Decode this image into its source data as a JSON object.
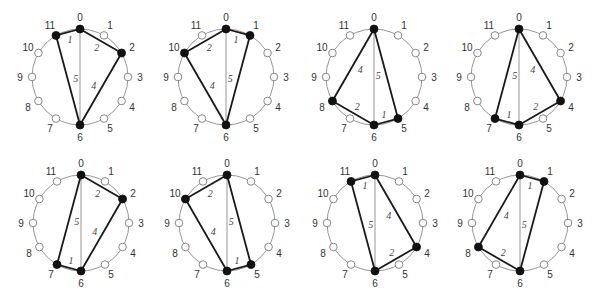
{
  "figure": {
    "point_labels": [
      "0",
      "1",
      "2",
      "3",
      "4",
      "5",
      "6",
      "7",
      "8",
      "9",
      "10",
      "11"
    ],
    "style": {
      "circle_color": "#8a8a8a",
      "edge_color": "#1a1a1a",
      "filled_point_color": "#111111",
      "open_point_fill": "#ffffff"
    },
    "diagrams": [
      {
        "id": 1,
        "cx": 80,
        "cy": 77,
        "filled": [
          0,
          2,
          6,
          11
        ],
        "edges": [
          {
            "from": 11,
            "to": 0,
            "label": "1"
          },
          {
            "from": 0,
            "to": 2,
            "label": "2"
          },
          {
            "from": 2,
            "to": 6,
            "label": "4"
          },
          {
            "from": 6,
            "to": 11,
            "label": "5"
          }
        ]
      },
      {
        "id": 2,
        "cx": 226,
        "cy": 77,
        "filled": [
          0,
          1,
          6,
          10
        ],
        "edges": [
          {
            "from": 0,
            "to": 1,
            "label": "1"
          },
          {
            "from": 1,
            "to": 6,
            "label": "5"
          },
          {
            "from": 6,
            "to": 10,
            "label": "4"
          },
          {
            "from": 10,
            "to": 0,
            "label": "2"
          }
        ]
      },
      {
        "id": 3,
        "cx": 374,
        "cy": 77,
        "filled": [
          0,
          5,
          6,
          8
        ],
        "edges": [
          {
            "from": 0,
            "to": 5,
            "label": "5"
          },
          {
            "from": 5,
            "to": 6,
            "label": "1"
          },
          {
            "from": 6,
            "to": 8,
            "label": "2"
          },
          {
            "from": 8,
            "to": 0,
            "label": "4"
          }
        ]
      },
      {
        "id": 4,
        "cx": 519,
        "cy": 77,
        "filled": [
          0,
          4,
          6,
          7
        ],
        "edges": [
          {
            "from": 0,
            "to": 4,
            "label": "4"
          },
          {
            "from": 4,
            "to": 6,
            "label": "2"
          },
          {
            "from": 6,
            "to": 7,
            "label": "1"
          },
          {
            "from": 7,
            "to": 0,
            "label": "5"
          }
        ]
      },
      {
        "id": 5,
        "cx": 81,
        "cy": 223,
        "filled": [
          0,
          2,
          6,
          7
        ],
        "edges": [
          {
            "from": 0,
            "to": 2,
            "label": "2"
          },
          {
            "from": 2,
            "to": 6,
            "label": "4"
          },
          {
            "from": 6,
            "to": 7,
            "label": "1"
          },
          {
            "from": 7,
            "to": 0,
            "label": "5"
          }
        ]
      },
      {
        "id": 6,
        "cx": 227,
        "cy": 223,
        "filled": [
          0,
          5,
          6,
          10
        ],
        "edges": [
          {
            "from": 0,
            "to": 5,
            "label": "5"
          },
          {
            "from": 5,
            "to": 6,
            "label": "1"
          },
          {
            "from": 6,
            "to": 10,
            "label": "4"
          },
          {
            "from": 10,
            "to": 0,
            "label": "2"
          }
        ]
      },
      {
        "id": 7,
        "cx": 375,
        "cy": 223,
        "filled": [
          0,
          4,
          6,
          11
        ],
        "edges": [
          {
            "from": 11,
            "to": 0,
            "label": "1"
          },
          {
            "from": 0,
            "to": 4,
            "label": "4"
          },
          {
            "from": 4,
            "to": 6,
            "label": "2"
          },
          {
            "from": 6,
            "to": 11,
            "label": "5"
          }
        ]
      },
      {
        "id": 8,
        "cx": 520,
        "cy": 223,
        "filled": [
          0,
          1,
          6,
          8
        ],
        "edges": [
          {
            "from": 0,
            "to": 1,
            "label": "1"
          },
          {
            "from": 1,
            "to": 6,
            "label": "5"
          },
          {
            "from": 6,
            "to": 8,
            "label": "2"
          },
          {
            "from": 8,
            "to": 0,
            "label": "4"
          }
        ]
      }
    ]
  }
}
